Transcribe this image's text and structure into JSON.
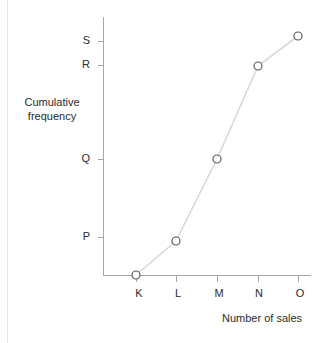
{
  "chart_data": {
    "type": "line",
    "title": "",
    "xlabel": "Number of sales",
    "ylabel": "Cumulative frequency",
    "categories": [
      "K",
      "L",
      "M",
      "N",
      "O"
    ],
    "x_tick_labels": [
      "K",
      "L",
      "M",
      "N",
      "O"
    ],
    "y_tick_labels": [
      "P",
      "Q",
      "R",
      "S"
    ],
    "series": [
      {
        "name": "Cumulative frequency",
        "points": [
          {
            "x": "K",
            "y": "0"
          },
          {
            "x": "L",
            "y": "just below P"
          },
          {
            "x": "M",
            "y": "Q"
          },
          {
            "x": "N",
            "y": "R"
          },
          {
            "x": "O",
            "y": "just above S"
          }
        ],
        "values": [
          0,
          0.95,
          2,
          3,
          4.1
        ]
      }
    ],
    "grid": false,
    "legend": false,
    "marker": "open-circle",
    "line_color": "#d9d9d9",
    "marker_stroke": "#595959",
    "axis_color": "#a6a6a6"
  },
  "axes": {
    "y_title_line1": "Cumulative",
    "y_title_line2": "frequency",
    "x_title": "Number of sales",
    "y_ticks": [
      {
        "label": "S",
        "top": 41
      },
      {
        "label": "R",
        "top": 65
      },
      {
        "label": "Q",
        "top": 159
      },
      {
        "label": "P",
        "top": 237
      }
    ],
    "x_ticks": [
      {
        "label": "K",
        "left": 136
      },
      {
        "label": "L",
        "left": 176
      },
      {
        "label": "M",
        "left": 217
      },
      {
        "label": "N",
        "left": 258
      },
      {
        "label": "O",
        "left": 298
      }
    ]
  },
  "markers": [
    {
      "name": "point-k",
      "cx": 136,
      "cy": 275
    },
    {
      "name": "point-l",
      "cx": 176,
      "cy": 241
    },
    {
      "name": "point-m",
      "cx": 217,
      "cy": 159
    },
    {
      "name": "point-n",
      "cx": 258,
      "cy": 66
    },
    {
      "name": "point-o",
      "cx": 298,
      "cy": 36
    }
  ],
  "polyline": "136,275 176,241 217,159 258,66 298,36"
}
